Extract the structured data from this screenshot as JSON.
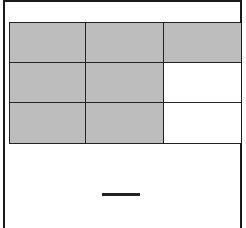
{
  "diagram": {
    "type": "fraction-area-model",
    "grid": {
      "rows": 3,
      "cols": 3,
      "total_parts": 9,
      "shaded_parts": 7,
      "cells": [
        [
          "shaded",
          "shaded",
          "shaded"
        ],
        [
          "shaded",
          "shaded",
          "unshaded"
        ],
        [
          "shaded",
          "shaded",
          "unshaded"
        ]
      ]
    },
    "answer_fraction": {
      "numerator": "",
      "denominator": ""
    },
    "colors": {
      "shaded": "#bdbdbd",
      "unshaded": "#ffffff",
      "lines": "#222222"
    }
  }
}
